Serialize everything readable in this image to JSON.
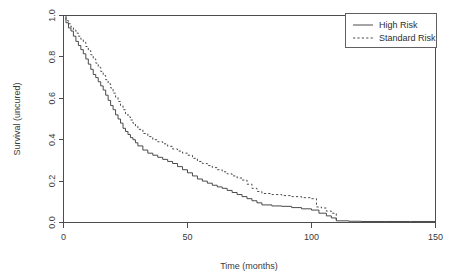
{
  "chart_data": {
    "type": "line",
    "title": "",
    "xlabel": "Time (months)",
    "ylabel": "Survival (uncured)",
    "xlim": [
      0,
      150
    ],
    "ylim": [
      0,
      1.0
    ],
    "xticks": [
      0,
      50,
      100,
      150
    ],
    "xtick_labels": [
      "0",
      "50",
      "100",
      "150"
    ],
    "yticks": [
      0.0,
      0.2,
      0.4,
      0.6,
      0.8,
      1.0
    ],
    "ytick_labels": [
      "0.0",
      "0.2",
      "0.4",
      "0.6",
      "0.8",
      "1.0"
    ],
    "grid": false,
    "legend_position": "top-right",
    "legend_entries": [
      "High Risk",
      "Standard Risk"
    ],
    "series": [
      {
        "name": "High Risk",
        "style": "solid",
        "color": "#4a4a4a",
        "x": [
          0,
          1,
          2,
          3,
          4,
          5,
          6,
          7,
          8,
          9,
          10,
          11,
          12,
          13,
          14,
          15,
          16,
          17,
          18,
          19,
          20,
          21,
          22,
          23,
          24,
          25,
          26,
          27,
          28,
          29,
          30,
          32,
          34,
          36,
          38,
          40,
          42,
          44,
          46,
          48,
          50,
          52,
          54,
          56,
          58,
          60,
          62,
          64,
          66,
          68,
          70,
          72,
          74,
          76,
          78,
          80,
          84,
          88,
          92,
          96,
          100,
          103,
          106,
          108,
          110,
          115,
          120,
          130,
          140,
          150
        ],
        "y": [
          1.0,
          0.965,
          0.94,
          0.925,
          0.9,
          0.875,
          0.855,
          0.835,
          0.815,
          0.79,
          0.765,
          0.74,
          0.715,
          0.7,
          0.68,
          0.66,
          0.64,
          0.615,
          0.59,
          0.565,
          0.545,
          0.52,
          0.5,
          0.48,
          0.455,
          0.44,
          0.425,
          0.41,
          0.4,
          0.385,
          0.37,
          0.35,
          0.335,
          0.325,
          0.315,
          0.305,
          0.295,
          0.285,
          0.27,
          0.255,
          0.24,
          0.225,
          0.21,
          0.2,
          0.19,
          0.18,
          0.172,
          0.165,
          0.155,
          0.145,
          0.135,
          0.125,
          0.115,
          0.105,
          0.095,
          0.085,
          0.08,
          0.078,
          0.072,
          0.066,
          0.06,
          0.045,
          0.032,
          0.022,
          0.008,
          0.006,
          0.005,
          0.005,
          0.005,
          0.005
        ]
      },
      {
        "name": "Standard Risk",
        "style": "dashed",
        "color": "#4a4a4a",
        "x": [
          0,
          1,
          2,
          3,
          4,
          5,
          6,
          7,
          8,
          9,
          10,
          11,
          12,
          13,
          14,
          15,
          16,
          17,
          18,
          19,
          20,
          21,
          22,
          23,
          24,
          25,
          26,
          27,
          28,
          29,
          30,
          32,
          34,
          36,
          38,
          40,
          42,
          44,
          46,
          48,
          50,
          52,
          54,
          56,
          58,
          60,
          62,
          64,
          66,
          68,
          70,
          72,
          74,
          76,
          78,
          80,
          84,
          88,
          92,
          96,
          100,
          102,
          104,
          106,
          108,
          110
        ],
        "y": [
          1.0,
          0.975,
          0.96,
          0.945,
          0.93,
          0.915,
          0.9,
          0.885,
          0.87,
          0.85,
          0.83,
          0.81,
          0.79,
          0.77,
          0.75,
          0.73,
          0.71,
          0.69,
          0.67,
          0.65,
          0.625,
          0.605,
          0.585,
          0.565,
          0.545,
          0.525,
          0.51,
          0.495,
          0.48,
          0.465,
          0.45,
          0.43,
          0.415,
          0.4,
          0.39,
          0.38,
          0.368,
          0.355,
          0.345,
          0.335,
          0.325,
          0.31,
          0.295,
          0.285,
          0.275,
          0.265,
          0.255,
          0.245,
          0.235,
          0.225,
          0.215,
          0.205,
          0.185,
          0.165,
          0.15,
          0.14,
          0.135,
          0.13,
          0.125,
          0.12,
          0.115,
          0.075,
          0.07,
          0.055,
          0.045,
          0.01
        ]
      }
    ]
  },
  "legend": {
    "items": [
      {
        "label": "High Risk",
        "style": "solid"
      },
      {
        "label": "Standard Risk",
        "style": "dashed"
      }
    ]
  },
  "axes": {
    "x_title": "Time (months)",
    "y_title": "Survival (uncured)"
  }
}
